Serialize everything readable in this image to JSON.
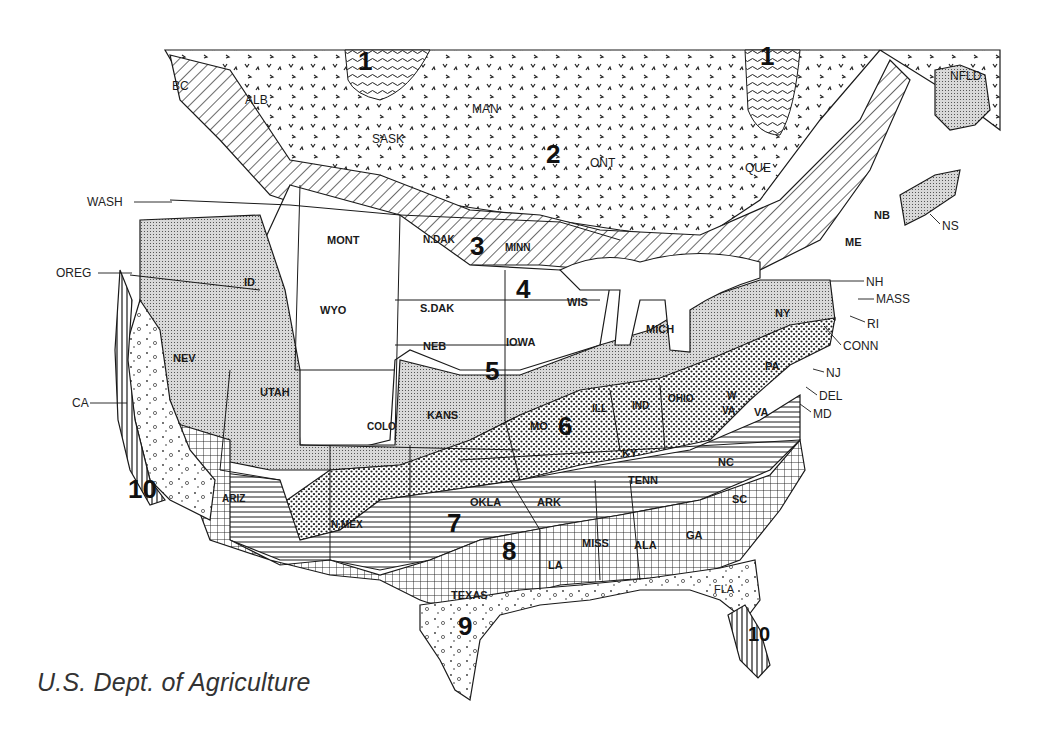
{
  "map": {
    "title": "Plant Hardiness Zone Map of North America",
    "credit": "U.S. Dept. of Agriculture",
    "colors": {
      "ink": "#1a1a1a",
      "background": "#ffffff",
      "light_fill": "#e6e6e6"
    },
    "zones": [
      {
        "id": "1",
        "label": "1",
        "pattern": "wavy-lines",
        "x": 358,
        "y": 60
      },
      {
        "id": "1b",
        "label": "1",
        "pattern": "wavy-lines",
        "x": 760,
        "y": 55
      },
      {
        "id": "2",
        "label": "2",
        "pattern": "v-marks",
        "x": 546,
        "y": 153
      },
      {
        "id": "3",
        "label": "3",
        "pattern": "diagonal-lines",
        "x": 470,
        "y": 245
      },
      {
        "id": "4",
        "label": "4",
        "pattern": "blank",
        "x": 516,
        "y": 288
      },
      {
        "id": "5",
        "label": "5",
        "pattern": "fine-grid",
        "x": 485,
        "y": 370
      },
      {
        "id": "6",
        "label": "6",
        "pattern": "dots",
        "x": 558,
        "y": 425
      },
      {
        "id": "7",
        "label": "7",
        "pattern": "horizontal-lines",
        "x": 447,
        "y": 522
      },
      {
        "id": "8",
        "label": "8",
        "pattern": "coarse-grid",
        "x": 502,
        "y": 550
      },
      {
        "id": "9",
        "label": "9",
        "pattern": "sparse-circles",
        "x": 458,
        "y": 625
      },
      {
        "id": "10",
        "label": "10",
        "pattern": "vertical-lines",
        "x": 128,
        "y": 488
      },
      {
        "id": "10b",
        "label": "10",
        "pattern": "vertical-lines",
        "x": 748,
        "y": 636
      }
    ],
    "regions": [
      {
        "abbr": "BC",
        "x": 172,
        "y": 80
      },
      {
        "abbr": "ALB",
        "x": 255,
        "y": 94
      },
      {
        "abbr": "SASK",
        "x": 372,
        "y": 133
      },
      {
        "abbr": "MAN",
        "x": 472,
        "y": 103
      },
      {
        "abbr": "ONT",
        "x": 605,
        "y": 157
      },
      {
        "abbr": "QUE",
        "x": 745,
        "y": 162
      },
      {
        "abbr": "NFLD",
        "x": 960,
        "y": 70
      },
      {
        "abbr": "MONT",
        "x": 327,
        "y": 235
      },
      {
        "abbr": "N.DAK",
        "x": 428,
        "y": 235
      },
      {
        "abbr": "MINN",
        "x": 508,
        "y": 243
      },
      {
        "abbr": "ID",
        "x": 244,
        "y": 277
      },
      {
        "abbr": "WYO",
        "x": 320,
        "y": 305
      },
      {
        "abbr": "S.DAK",
        "x": 420,
        "y": 303
      },
      {
        "abbr": "WIS",
        "x": 567,
        "y": 297
      },
      {
        "abbr": "NEB",
        "x": 423,
        "y": 341
      },
      {
        "abbr": "IOWA",
        "x": 506,
        "y": 337
      },
      {
        "abbr": "NEV",
        "x": 173,
        "y": 353
      },
      {
        "abbr": "UTAH",
        "x": 260,
        "y": 387
      },
      {
        "abbr": "COLO",
        "x": 367,
        "y": 422
      },
      {
        "abbr": "KANS",
        "x": 427,
        "y": 410
      },
      {
        "abbr": "MO",
        "x": 530,
        "y": 421
      },
      {
        "abbr": "ILL",
        "x": 592,
        "y": 404
      },
      {
        "abbr": "IND",
        "x": 635,
        "y": 401
      },
      {
        "abbr": "OHIO",
        "x": 668,
        "y": 394
      },
      {
        "abbr": "MICH",
        "x": 648,
        "y": 324
      },
      {
        "abbr": "NY",
        "x": 775,
        "y": 308
      },
      {
        "abbr": "PA",
        "x": 765,
        "y": 361
      },
      {
        "abbr": "W",
        "x": 727,
        "y": 393
      },
      {
        "abbr": "VA",
        "x": 722,
        "y": 408
      },
      {
        "abbr": "VA2",
        "text": "VA",
        "x": 754,
        "y": 407
      },
      {
        "abbr": "KY",
        "x": 625,
        "y": 450
      },
      {
        "abbr": "NC",
        "x": 718,
        "y": 457
      },
      {
        "abbr": "TENN",
        "x": 634,
        "y": 475
      },
      {
        "abbr": "SC",
        "x": 732,
        "y": 494
      },
      {
        "abbr": "OKLA",
        "x": 470,
        "y": 497
      },
      {
        "abbr": "ARK",
        "x": 537,
        "y": 497
      },
      {
        "abbr": "ARIZ",
        "x": 222,
        "y": 496
      },
      {
        "abbr": "N.MEX",
        "x": 331,
        "y": 520
      },
      {
        "abbr": "MISS",
        "x": 594,
        "y": 538
      },
      {
        "abbr": "ALA",
        "x": 638,
        "y": 540
      },
      {
        "abbr": "GA",
        "x": 688,
        "y": 530
      },
      {
        "abbr": "LA",
        "x": 548,
        "y": 560
      },
      {
        "abbr": "TEXAS",
        "x": 451,
        "y": 590
      },
      {
        "abbr": "FLA",
        "x": 714,
        "y": 584
      },
      {
        "abbr": "NB",
        "x": 876,
        "y": 210
      },
      {
        "abbr": "ME",
        "x": 847,
        "y": 237
      }
    ],
    "callouts": [
      {
        "abbr": "WASH",
        "x": 87,
        "y": 196,
        "line_to": [
          170,
          202
        ]
      },
      {
        "abbr": "OREG",
        "x": 56,
        "y": 268,
        "line_to": [
          132,
          273
        ]
      },
      {
        "abbr": "CA",
        "x": 72,
        "y": 398,
        "line_to": [
          127,
          403
        ]
      },
      {
        "abbr": "NS",
        "x": 942,
        "y": 220,
        "line_to": [
          930,
          214
        ]
      },
      {
        "abbr": "NH",
        "x": 866,
        "y": 277,
        "line_to": [
          830,
          279
        ]
      },
      {
        "abbr": "MASS",
        "x": 876,
        "y": 294,
        "line_to": [
          860,
          299
        ]
      },
      {
        "abbr": "RI",
        "x": 867,
        "y": 319,
        "line_to": [
          850,
          314
        ]
      },
      {
        "abbr": "CONN",
        "x": 843,
        "y": 341,
        "line_to": [
          823,
          323
        ]
      },
      {
        "abbr": "NJ",
        "x": 826,
        "y": 369,
        "line_to": [
          813,
          367
        ]
      },
      {
        "abbr": "DEL",
        "x": 819,
        "y": 391,
        "line_to": [
          805,
          385
        ]
      },
      {
        "abbr": "MD",
        "x": 813,
        "y": 409,
        "line_to": [
          800,
          402
        ]
      }
    ]
  }
}
